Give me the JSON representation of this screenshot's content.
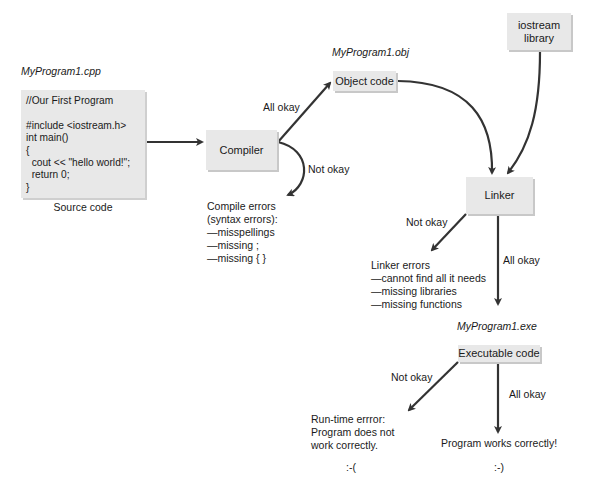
{
  "source": {
    "filename": "MyProgram1.cpp",
    "code_lines": [
      "//Our First Program",
      "",
      "#include <iostream.h>",
      "int main()",
      "{",
      "  cout << \"hello world!\";",
      "  return 0;",
      "}"
    ],
    "caption": "Source code"
  },
  "compiler": {
    "label": "Compiler",
    "all_okay": "All okay",
    "not_okay": "Not okay",
    "errors": {
      "title_1": "Compile errors",
      "title_2": "(syntax errors):",
      "items": [
        "—misspellings",
        "—missing ;",
        "—missing { }"
      ]
    }
  },
  "object": {
    "filename": "MyProgram1.obj",
    "label": "Object code"
  },
  "library": {
    "line1": "iostream",
    "line2": "library"
  },
  "linker": {
    "label": "Linker",
    "not_okay": "Not okay",
    "all_okay": "All okay",
    "errors": {
      "title": "Linker errors",
      "items": [
        "—cannot find all it needs",
        "—missing libraries",
        "—missing functions"
      ]
    }
  },
  "executable": {
    "filename": "MyProgram1.exe",
    "label": "Executable code",
    "not_okay": "Not okay",
    "all_okay": "All okay"
  },
  "outcomes": {
    "failure": {
      "lines": [
        "Run-time errror:",
        "Program does not",
        "work correctly."
      ],
      "emoticon": ":-("
    },
    "success": {
      "text": "Program works correctly!",
      "emoticon": ":-)"
    }
  },
  "colors": {
    "box_fill": "#e8e8e8",
    "arrow": "#333333"
  }
}
